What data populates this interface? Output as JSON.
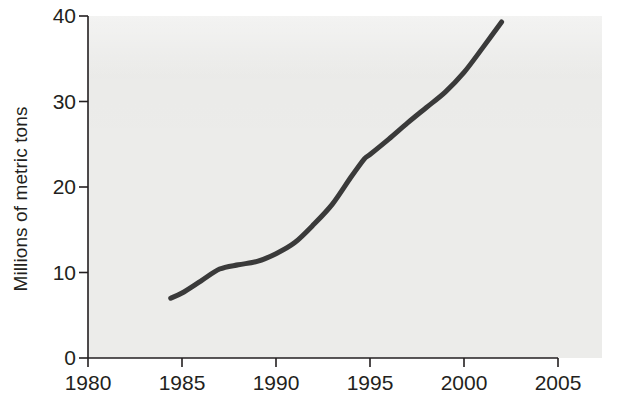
{
  "chart": {
    "title": "",
    "ylabel": "Millions of metric tons",
    "xlabel": "",
    "background_color": "#ececea",
    "line_color": "#3a3a3a",
    "axis_color": "#231f20",
    "text_color": "#231f20"
  },
  "axes": {
    "x_ticks": [
      "1980",
      "1985",
      "1990",
      "1995",
      "2000",
      "2005"
    ],
    "y_ticks": [
      "0",
      "10",
      "20",
      "30",
      "40"
    ]
  },
  "chart_data": {
    "type": "line",
    "title": "",
    "xlabel": "",
    "ylabel": "Millions of metric tons",
    "xlim": [
      1980,
      2005
    ],
    "ylim": [
      0,
      40
    ],
    "xticks": [
      1980,
      1985,
      1990,
      1995,
      2000,
      2005
    ],
    "yticks": [
      0,
      10,
      20,
      30,
      40
    ],
    "grid": false,
    "legend": null,
    "series": [
      {
        "name": "Millions of metric tons",
        "color": "#3a3a3a",
        "x": [
          1984.4,
          1985,
          1986,
          1987,
          1988,
          1989,
          1990,
          1991,
          1992,
          1993,
          1994,
          1994.7,
          1995,
          1996,
          1997,
          1998,
          1999,
          2000,
          2001,
          2002
        ],
        "values": [
          7.0,
          7.6,
          9.0,
          10.4,
          10.9,
          11.3,
          12.2,
          13.5,
          15.6,
          18.0,
          21.2,
          23.3,
          23.8,
          25.6,
          27.5,
          29.3,
          31.1,
          33.4,
          36.3,
          39.3
        ]
      }
    ]
  }
}
